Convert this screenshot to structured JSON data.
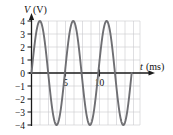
{
  "chart_data": {
    "type": "line",
    "title": "",
    "subtitle": "",
    "xlabel": "t",
    "xunit": "(ms)",
    "xlabel_full": "t (ms)",
    "ylabel": "V",
    "yunit": "(V)",
    "ylabel_full": "V (V)",
    "xlim": [
      0,
      13
    ],
    "ylim": [
      -4,
      4
    ],
    "xticks": [
      5,
      10
    ],
    "xtick_labels": [
      "5",
      "10"
    ],
    "yticks": [
      4,
      3,
      2,
      1,
      0,
      -1,
      -2,
      -3,
      -4
    ],
    "ytick_labels": [
      "4",
      "3",
      "2",
      "1",
      "0",
      "−1",
      "−2",
      "−3",
      "−4"
    ],
    "grid": true,
    "grid_x_step": 1,
    "grid_y_step": 1,
    "legend": null,
    "legend_position": "none",
    "series": [
      {
        "name": "V(t)",
        "waveform": "sine",
        "amplitude": 4,
        "period": 4,
        "phase_deg": 0,
        "offset": 0,
        "color": "#6f6f73",
        "peaks_t": [
          1,
          5,
          9
        ],
        "troughs_t": [
          3,
          7,
          11
        ],
        "zero_crossings_t": [
          0,
          2,
          4,
          6,
          8,
          10,
          12
        ],
        "points": [
          {
            "t": 0.0,
            "v": 0.0
          },
          {
            "t": 0.5,
            "v": 2.83
          },
          {
            "t": 1.0,
            "v": 4.0
          },
          {
            "t": 1.5,
            "v": 2.83
          },
          {
            "t": 2.0,
            "v": 0.0
          },
          {
            "t": 2.5,
            "v": -2.83
          },
          {
            "t": 3.0,
            "v": -4.0
          },
          {
            "t": 3.5,
            "v": -2.83
          },
          {
            "t": 4.0,
            "v": 0.0
          },
          {
            "t": 4.5,
            "v": 2.83
          },
          {
            "t": 5.0,
            "v": 4.0
          },
          {
            "t": 5.5,
            "v": 2.83
          },
          {
            "t": 6.0,
            "v": 0.0
          },
          {
            "t": 6.5,
            "v": -2.83
          },
          {
            "t": 7.0,
            "v": -4.0
          },
          {
            "t": 7.5,
            "v": -2.83
          },
          {
            "t": 8.0,
            "v": 0.0
          },
          {
            "t": 8.5,
            "v": 2.83
          },
          {
            "t": 9.0,
            "v": 4.0
          },
          {
            "t": 9.5,
            "v": 2.83
          },
          {
            "t": 10.0,
            "v": 0.0
          },
          {
            "t": 10.5,
            "v": -2.83
          },
          {
            "t": 11.0,
            "v": -4.0
          },
          {
            "t": 11.5,
            "v": -2.83
          },
          {
            "t": 12.0,
            "v": 0.0
          }
        ]
      }
    ],
    "colors": {
      "curve": "#6f6f73",
      "axis": "#1a1a1a",
      "grid": "#c9c9cf",
      "text": "#111111",
      "background": "#ffffff"
    }
  }
}
